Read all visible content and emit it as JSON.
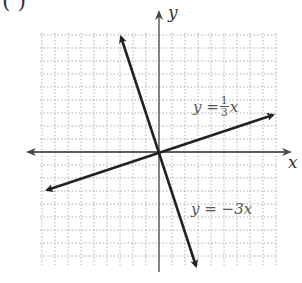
{
  "corner_label": "( )",
  "chart_data": {
    "type": "line",
    "title": "",
    "xlabel": "x",
    "ylabel": "y",
    "grid": true,
    "xlim": [
      -9,
      9
    ],
    "ylim": [
      -9,
      9
    ],
    "series": [
      {
        "name": "y = 1/3 x",
        "slope": 0.3333,
        "x": [
          -8.5,
          8.5
        ],
        "y": [
          -2.83,
          2.83
        ]
      },
      {
        "name": "y = -3x",
        "slope": -3,
        "x": [
          -3,
          3
        ],
        "y": [
          9,
          -9
        ]
      }
    ],
    "annotations": [
      {
        "text": "y = 1/3 x",
        "near": "upper right of line y=1/3x"
      },
      {
        "text": "y = -3x",
        "near": "lower right along line y=-3x"
      }
    ]
  },
  "labels": {
    "x_axis": "x",
    "y_axis": "y",
    "eq1_lhs": "y =",
    "eq1_num": "1",
    "eq1_den": "3",
    "eq1_var": "x",
    "eq2": "y = −3x"
  }
}
